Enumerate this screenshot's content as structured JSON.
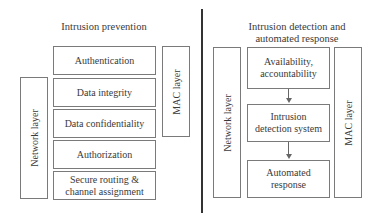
{
  "left_panel": {
    "title": "Intrusion prevention",
    "network_layer": "Network layer",
    "mac_layer": "MAC layer",
    "stack": [
      "Authentication",
      "Data integrity",
      "Data confidentiality",
      "Authorization",
      "Secure routing & channel assignment"
    ]
  },
  "right_panel": {
    "title_line1": "Intrusion detection and",
    "title_line2": "automated response",
    "network_layer": "Network layer",
    "mac_layer": "MAC layer",
    "flow": [
      {
        "line1": "Availability,",
        "line2": "accountability"
      },
      {
        "line1": "Intrusion",
        "line2": "detection system"
      },
      {
        "line1": "Automated",
        "line2": "response"
      }
    ]
  }
}
